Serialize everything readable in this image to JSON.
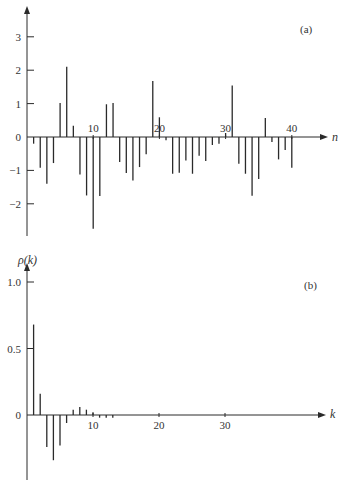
{
  "chart_data": [
    {
      "type": "stem",
      "panel_label": "(a)",
      "xlabel": "n",
      "ylabel": "",
      "ylim": [
        -3,
        3.8
      ],
      "xlim": [
        0,
        44
      ],
      "xticks": [
        10,
        20,
        30,
        40
      ],
      "xtick_labels": [
        "10",
        "20",
        "30",
        "40"
      ],
      "yticks": [
        -2,
        -1,
        0,
        1,
        2,
        3
      ],
      "ytick_labels": [
        "−2",
        "−1",
        "0",
        "1",
        "2",
        "3"
      ],
      "grid": false,
      "x": [
        1,
        2,
        3,
        4,
        5,
        6,
        7,
        8,
        9,
        10,
        11,
        12,
        13,
        14,
        15,
        16,
        17,
        18,
        19,
        20,
        21,
        22,
        23,
        24,
        25,
        26,
        27,
        28,
        29,
        30,
        31,
        32,
        33,
        34,
        35,
        36,
        37,
        38,
        39,
        40
      ],
      "values": [
        -0.2,
        -0.92,
        -1.4,
        -0.78,
        1.02,
        2.1,
        0.34,
        -1.12,
        -1.75,
        -2.75,
        -1.77,
        0.98,
        1.02,
        -0.75,
        -1.08,
        -1.3,
        -0.9,
        -0.52,
        1.68,
        0.59,
        -0.1,
        -1.1,
        -1.07,
        -0.7,
        -1.1,
        -0.56,
        -0.72,
        -0.24,
        -0.2,
        0.12,
        1.54,
        -0.8,
        -1.1,
        -1.76,
        -1.26,
        0.57,
        -0.15,
        -0.67,
        -0.39,
        -0.92
      ]
    },
    {
      "type": "stem",
      "panel_label": "(b)",
      "xlabel": "k",
      "ylabel": "ρ(k)",
      "ylim": [
        -0.48,
        1.2
      ],
      "xlim": [
        0,
        44
      ],
      "xticks": [
        10,
        20,
        30
      ],
      "xtick_labels": [
        "10",
        "20",
        "30"
      ],
      "yticks": [
        0,
        0.5,
        1.0
      ],
      "ytick_labels": [
        "0",
        "0.5",
        "1.0"
      ],
      "grid": false,
      "x": [
        1,
        2,
        3,
        4,
        5,
        6,
        7,
        8,
        9,
        10,
        11,
        12,
        13
      ],
      "values": [
        0.68,
        0.16,
        -0.24,
        -0.34,
        -0.23,
        -0.06,
        0.04,
        0.06,
        0.04,
        0.02,
        -0.02,
        -0.02,
        -0.02
      ]
    }
  ]
}
